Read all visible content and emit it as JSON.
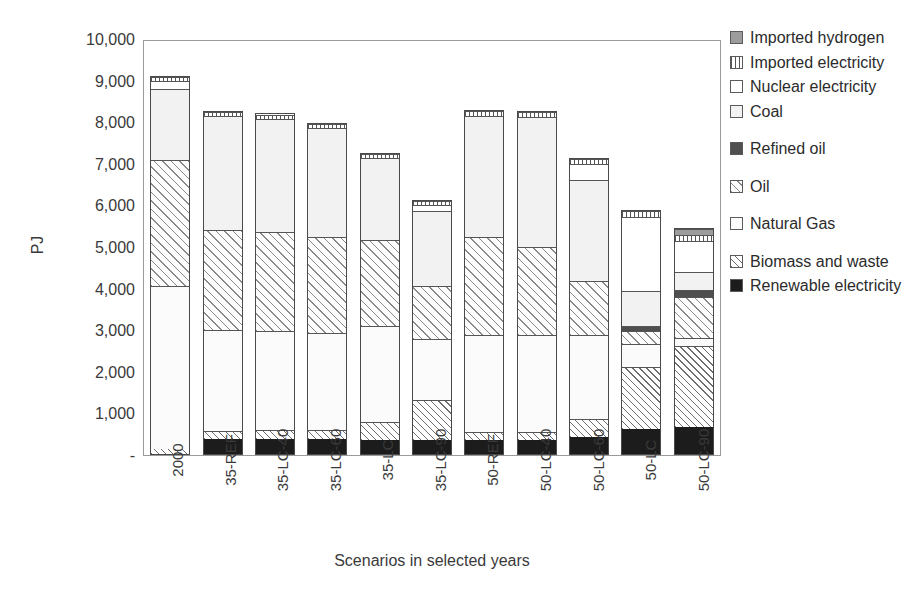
{
  "chart_data": {
    "type": "bar",
    "subtype": "stacked-bar",
    "title": "",
    "xlabel": "Scenarios in selected years",
    "ylabel": "PJ",
    "ylim": [
      0,
      10000
    ],
    "ytick_labels": [
      "10,000",
      "9,000",
      "8,000",
      "7,000",
      "6,000",
      "5,000",
      "4,000",
      "3,000",
      "2,000",
      "1,000",
      "-"
    ],
    "ytick_values": [
      10000,
      9000,
      8000,
      7000,
      6000,
      5000,
      4000,
      3000,
      2000,
      1000,
      0
    ],
    "grid": false,
    "legend_position": "right",
    "categories": [
      "2000",
      "35-REF",
      "35-LC-40",
      "35-LC-60",
      "35-LC",
      "35-LC-90",
      "50-REF",
      "50-LC-40",
      "50-LC-60",
      "50-LC",
      "50-LC-90"
    ],
    "series": [
      {
        "name": "Renewable electricity",
        "fill": "f-renewable",
        "values": [
          0,
          370,
          370,
          370,
          350,
          330,
          350,
          350,
          400,
          600,
          650
        ]
      },
      {
        "name": "Biomass and waste",
        "fill": "f-biomass",
        "values": [
          110,
          190,
          200,
          200,
          430,
          980,
          190,
          190,
          450,
          1500,
          1960
        ]
      },
      {
        "name": "Natural Gas",
        "fill": "f-gas",
        "values": [
          3960,
          2440,
          2400,
          2360,
          2320,
          1470,
          2350,
          2330,
          2030,
          560,
          210
        ]
      },
      {
        "name": "Oil",
        "fill": "f-oil",
        "values": [
          3040,
          2410,
          2390,
          2330,
          2070,
          1280,
          2350,
          2130,
          1300,
          310,
          990
        ]
      },
      {
        "name": "Refined oil",
        "fill": "f-refinedoil",
        "values": [
          0,
          0,
          0,
          0,
          0,
          0,
          0,
          0,
          0,
          130,
          170
        ]
      },
      {
        "name": "Coal",
        "fill": "f-coal",
        "values": [
          1710,
          2770,
          2740,
          2620,
          1990,
          1840,
          2940,
          3150,
          2450,
          850,
          440
        ]
      },
      {
        "name": "Nuclear electricity",
        "fill": "f-nuclear",
        "values": [
          190,
          0,
          0,
          0,
          0,
          130,
          0,
          0,
          400,
          1800,
          740
        ]
      },
      {
        "name": "Imported electricity",
        "fill": "f-impelec",
        "values": [
          110,
          100,
          110,
          110,
          110,
          110,
          110,
          110,
          110,
          150,
          160
        ]
      },
      {
        "name": "Imported hydrogen",
        "fill": "f-imphyd",
        "values": [
          0,
          0,
          0,
          0,
          0,
          0,
          0,
          0,
          0,
          0,
          130
        ]
      }
    ],
    "totals": [
      9120,
      8280,
      8210,
      7990,
      7270,
      6140,
      8290,
      8260,
      7140,
      5900,
      5450
    ]
  },
  "legend": {
    "entries": [
      {
        "label": "Imported hydrogen",
        "swatch": "f-imphyd",
        "gap": 0
      },
      {
        "label": "Imported electricity",
        "swatch": "f-impelec",
        "gap": 0
      },
      {
        "label": "Nuclear electricity",
        "swatch": "f-nuclear",
        "gap": 0
      },
      {
        "label": "Coal",
        "swatch": "f-coal",
        "gap": 1
      },
      {
        "label": "Refined oil",
        "swatch": "f-refinedoil",
        "gap": 1
      },
      {
        "label": "Oil",
        "swatch": "f-oil",
        "gap": 1
      },
      {
        "label": "Natural Gas",
        "swatch": "f-gas",
        "gap": 1
      },
      {
        "label": "Biomass and waste",
        "swatch": "f-biomass",
        "gap": 0
      },
      {
        "label": "Renewable electricity",
        "swatch": "f-renewable",
        "gap": 0
      }
    ]
  }
}
